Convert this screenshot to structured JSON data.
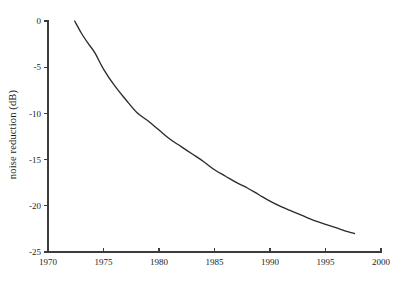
{
  "chart_data": {
    "type": "line",
    "title": "",
    "subtitle": "",
    "xlabel": "",
    "ylabel": "noise reduction (dB)",
    "xlim": [
      1970,
      2000
    ],
    "ylim": [
      -25,
      0
    ],
    "grid": false,
    "legend": null,
    "legend_position": "none",
    "x_ticks": [
      1970,
      1975,
      1980,
      1985,
      1990,
      1995,
      2000
    ],
    "x_tick_labels": [
      "1970",
      "1975",
      "1980",
      "1985",
      "1990",
      "1995",
      "2000"
    ],
    "y_ticks": [
      0,
      -5,
      -10,
      -15,
      -20,
      -25
    ],
    "y_tick_labels": [
      "0",
      "-5",
      "-10",
      "-15",
      "-20",
      "-25"
    ],
    "series": [
      {
        "name": "noise reduction",
        "color": "#2b2b2b",
        "x": [
          1972.4,
          1973.0,
          1973.6,
          1974.2,
          1975.0,
          1976.0,
          1977.0,
          1978.0,
          1979.0,
          1980.0,
          1981.0,
          1982.0,
          1983.0,
          1984.0,
          1985.0,
          1986.0,
          1987.0,
          1988.0,
          1989.0,
          1990.0,
          1991.0,
          1992.0,
          1993.0,
          1994.0,
          1995.0,
          1996.0,
          1997.0,
          1997.6
        ],
        "values": [
          0.0,
          -1.3,
          -2.4,
          -3.4,
          -5.2,
          -7.0,
          -8.5,
          -9.9,
          -10.8,
          -11.8,
          -12.8,
          -13.6,
          -14.4,
          -15.2,
          -16.1,
          -16.8,
          -17.5,
          -18.1,
          -18.8,
          -19.5,
          -20.1,
          -20.6,
          -21.1,
          -21.6,
          -22.0,
          -22.4,
          -22.8,
          -23.0
        ]
      }
    ],
    "annotations": []
  },
  "figure": {
    "background_color": "#ffffff",
    "axis_color": "#3c3c3c",
    "text_color": "#232323"
  }
}
